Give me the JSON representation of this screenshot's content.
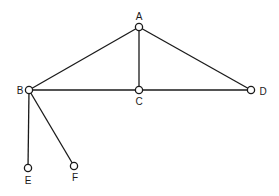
{
  "diagram": {
    "type": "graph",
    "nodes": [
      {
        "id": "A",
        "label": "A",
        "x": 139,
        "y": 27,
        "lx": 139,
        "ly": 20,
        "anchor": "middle"
      },
      {
        "id": "B",
        "label": "B",
        "x": 29,
        "y": 90,
        "lx": 20,
        "ly": 94,
        "anchor": "middle"
      },
      {
        "id": "C",
        "label": "C",
        "x": 139,
        "y": 90,
        "lx": 139,
        "ly": 105,
        "anchor": "middle"
      },
      {
        "id": "D",
        "label": "D",
        "x": 251,
        "y": 90,
        "lx": 263,
        "ly": 95,
        "anchor": "middle"
      },
      {
        "id": "E",
        "label": "E",
        "x": 28,
        "y": 168,
        "lx": 28,
        "ly": 184,
        "anchor": "middle"
      },
      {
        "id": "F",
        "label": "F",
        "x": 74,
        "y": 166,
        "lx": 75,
        "ly": 181,
        "anchor": "middle"
      }
    ],
    "edges": [
      {
        "from": "A",
        "to": "B"
      },
      {
        "from": "A",
        "to": "C"
      },
      {
        "from": "A",
        "to": "D"
      },
      {
        "from": "B",
        "to": "C"
      },
      {
        "from": "C",
        "to": "D"
      },
      {
        "from": "B",
        "to": "E"
      },
      {
        "from": "B",
        "to": "F"
      }
    ],
    "colors": {
      "stroke": "#1a1a1a",
      "background": "#ffffff"
    }
  }
}
